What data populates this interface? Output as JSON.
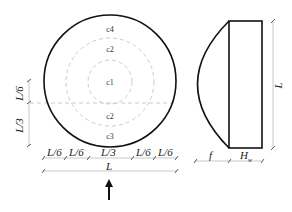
{
  "plan_view": {
    "zones": [
      "c4",
      "c2",
      "c1",
      "c2",
      "c3"
    ],
    "bottom_dims": [
      "L/6",
      "L/6",
      "L/3",
      "L/6",
      "L/6"
    ],
    "overall_width": "L",
    "left_dims": [
      "L/6",
      "L/3"
    ],
    "arrow": "up-arrow"
  },
  "side_view": {
    "height_label": "L",
    "f_label": "f",
    "h_label": "H",
    "h_subscript": "w"
  },
  "colors": {
    "outline": "#111111",
    "dim": "#bbbbbb",
    "dashed": "#cccccc"
  }
}
